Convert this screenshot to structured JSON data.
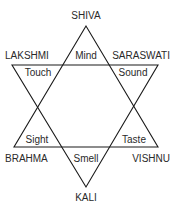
{
  "diagram": {
    "type": "hexagram",
    "vertices": {
      "top": "SHIVA",
      "upper_left": "LAKSHMI",
      "upper_right": "SARASWATI",
      "lower_left": "BRAHMA",
      "lower_right": "VISHNU",
      "bottom": "KALI"
    },
    "points": {
      "top": "Mind",
      "upper_left": "Touch",
      "upper_right": "Sound",
      "lower_left": "Sight",
      "lower_right": "Taste",
      "bottom": "Smell"
    },
    "colors": {
      "line": "#1a1a1a",
      "text": "#2a2a2a",
      "background": "#ffffff"
    }
  }
}
